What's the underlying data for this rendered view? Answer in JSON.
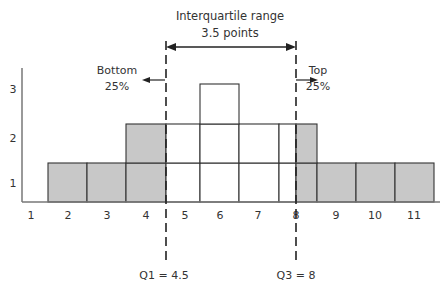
{
  "chart_data": {
    "type": "bar",
    "subtype": "dot-block histogram with quartile markers",
    "title": "Interquartile range",
    "subtitle": "3.5 points",
    "xlabel": "",
    "ylabel": "",
    "x_ticks": [
      "1",
      "2",
      "3",
      "4",
      "5",
      "6",
      "7",
      "8",
      "9",
      "10",
      "11"
    ],
    "y_ticks": [
      "1",
      "2",
      "3"
    ],
    "ylim": [
      0,
      3
    ],
    "grid": false,
    "categories": [
      "2",
      "3",
      "4",
      "5",
      "6",
      "7",
      "8",
      "9",
      "10",
      "11"
    ],
    "values": [
      1,
      1,
      2,
      2,
      3,
      2,
      2,
      1,
      1,
      1
    ],
    "shaded_regions": [
      {
        "name": "Bottom 25%",
        "range": [
          "2",
          "4.5"
        ]
      },
      {
        "name": "Top 25%",
        "range": [
          "8",
          "11"
        ]
      }
    ],
    "annotations": {
      "iqr_title": "Interquartile range",
      "iqr_value": "3.5 points",
      "bottom_label": "Bottom",
      "bottom_pct": "25%",
      "top_label": "Top",
      "top_pct": "25%",
      "q1_label": "Q1 = 4.5",
      "q3_label": "Q3 = 8"
    },
    "q1": 4.5,
    "q3": 8,
    "colors": {
      "shaded": "#c8c8c8",
      "unshaded": "#ffffff",
      "line": "#333333"
    }
  }
}
